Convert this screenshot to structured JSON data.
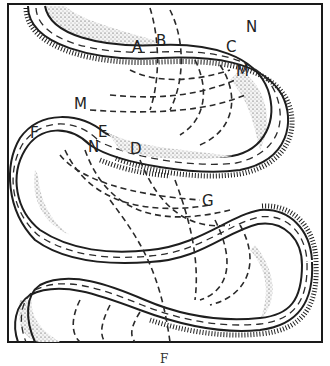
{
  "figure": {
    "type": "meandering-river-diagram",
    "labels": [
      {
        "id": "A",
        "text": "A",
        "x": 140,
        "y": 50
      },
      {
        "id": "B",
        "text": "B",
        "x": 158,
        "y": 45
      },
      {
        "id": "C-top",
        "text": "C",
        "x": 228,
        "y": 49
      },
      {
        "id": "N-top",
        "text": "N",
        "x": 250,
        "y": 30
      },
      {
        "id": "M-top",
        "text": "M",
        "x": 238,
        "y": 74
      },
      {
        "id": "M-mid",
        "text": "M",
        "x": 74,
        "y": 108
      },
      {
        "id": "F",
        "text": "F",
        "x": 30,
        "y": 136
      },
      {
        "id": "E",
        "text": "E",
        "x": 98,
        "y": 134
      },
      {
        "id": "N-mid",
        "text": "N",
        "x": 87,
        "y": 150
      },
      {
        "id": "D",
        "text": "D",
        "x": 130,
        "y": 153
      },
      {
        "id": "G",
        "text": "G",
        "x": 203,
        "y": 205
      }
    ],
    "caption": "F"
  }
}
